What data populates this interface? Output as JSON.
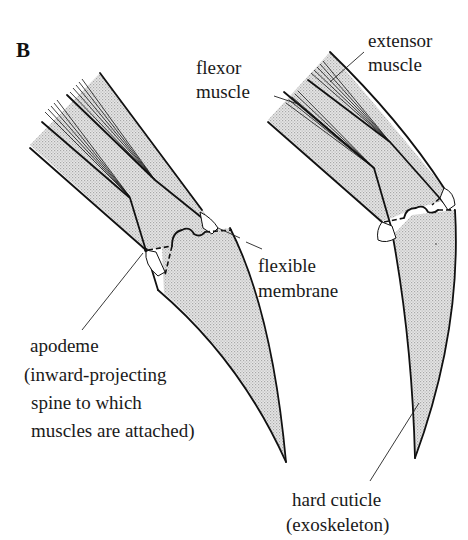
{
  "figure": {
    "panel_label": "B",
    "shade_color": "#d9d9d9",
    "line_color": "#111111",
    "background": "#ffffff"
  },
  "labels": {
    "flexor_muscle": {
      "line1": "flexor",
      "line2": "muscle"
    },
    "extensor_muscle": {
      "line1": "extensor",
      "line2": "muscle"
    },
    "flexible_membrane": {
      "line1": "flexible",
      "line2": "membrane"
    },
    "apodeme": {
      "line1": "apodeme",
      "line2": "(inward-projecting",
      "line3": "spine to which",
      "line4": "muscles are attached)"
    },
    "hard_cuticle": {
      "line1": "hard cuticle",
      "line2": "(exoskeleton)"
    }
  },
  "limbs": [
    {
      "id": "left",
      "state": "extended"
    },
    {
      "id": "right",
      "state": "flexed"
    }
  ]
}
